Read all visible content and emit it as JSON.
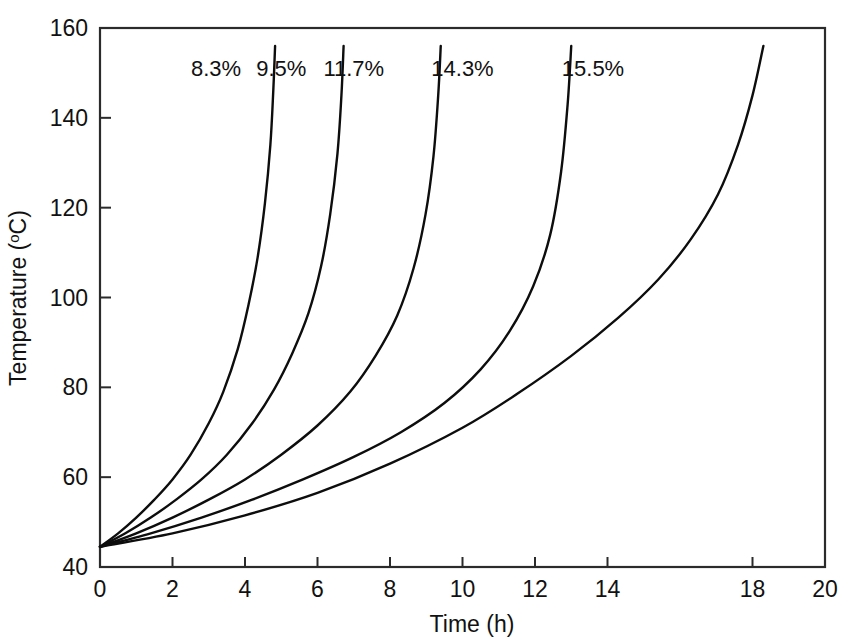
{
  "chart_data": {
    "type": "line",
    "title": "",
    "xlabel": "Time (h)",
    "ylabel": "Temperature (°C)",
    "ylabel_base": "Temperature (",
    "ylabel_degree": "o",
    "ylabel_tail": "C)",
    "xlim": [
      0,
      20
    ],
    "ylim": [
      40,
      160
    ],
    "xticks": [
      0,
      2,
      4,
      6,
      8,
      10,
      12,
      14,
      18,
      20
    ],
    "xtick_labels": [
      "0",
      "2",
      "4",
      "6",
      "8",
      "10",
      "12",
      "14",
      "18",
      "20"
    ],
    "yticks": [
      40,
      60,
      80,
      100,
      120,
      140,
      160
    ],
    "ytick_labels": [
      "40",
      "60",
      "80",
      "100",
      "120",
      "140",
      "160"
    ],
    "grid": false,
    "legend_position": "inline-curve-labels",
    "line_color": "#0d0d0d",
    "frame_color": "#2b2b2b",
    "background_color": "#ffffff",
    "start_point": [
      0,
      44.5
    ],
    "series": [
      {
        "name": "8.3%",
        "label": "8.3%",
        "label_at": [
          3.2,
          151
        ],
        "x": [
          0,
          0.5,
          1.0,
          1.5,
          2.0,
          2.5,
          3.0,
          3.4,
          3.8,
          4.1,
          4.35,
          4.55,
          4.7,
          4.78,
          4.83
        ],
        "y": [
          44.5,
          47.5,
          51.0,
          55.0,
          59.5,
          65.0,
          72.0,
          79.0,
          88.5,
          98.5,
          109.0,
          121.0,
          134.0,
          146.0,
          156.0
        ]
      },
      {
        "name": "9.5%",
        "label": "9.5%",
        "label_at": [
          5.0,
          151
        ],
        "x": [
          0,
          0.7,
          1.4,
          2.1,
          2.8,
          3.5,
          4.2,
          4.8,
          5.3,
          5.75,
          6.1,
          6.35,
          6.55,
          6.66,
          6.72
        ],
        "y": [
          44.5,
          47.5,
          51.0,
          55.0,
          59.5,
          65.0,
          72.0,
          79.5,
          87.5,
          96.5,
          107.0,
          118.5,
          132.0,
          145.0,
          156.0
        ]
      },
      {
        "name": "11.7%",
        "label": "11.7%",
        "label_at": [
          7.0,
          151
        ],
        "x": [
          0,
          1.0,
          2.0,
          3.0,
          4.0,
          5.0,
          6.0,
          6.9,
          7.6,
          8.2,
          8.65,
          8.98,
          9.2,
          9.33,
          9.4
        ],
        "y": [
          44.5,
          47.5,
          51.0,
          55.0,
          59.5,
          65.0,
          71.5,
          79.0,
          87.0,
          96.0,
          106.5,
          118.5,
          131.5,
          145.0,
          156.0
        ]
      },
      {
        "name": "14.3%",
        "label": "14.3%",
        "label_at": [
          10.0,
          151
        ],
        "x": [
          0,
          1.4,
          2.8,
          4.2,
          5.6,
          7.0,
          8.3,
          9.5,
          10.5,
          11.3,
          11.95,
          12.42,
          12.72,
          12.9,
          13.0
        ],
        "y": [
          44.5,
          47.5,
          51.0,
          55.0,
          59.5,
          64.5,
          70.0,
          76.5,
          84.0,
          92.5,
          102.5,
          114.0,
          128.0,
          143.0,
          156.0
        ]
      },
      {
        "name": "15.5%",
        "label": "15.5%",
        "label_at": [
          13.6,
          151
        ],
        "x": [
          0,
          2.0,
          4.0,
          6.0,
          8.0,
          10.0,
          11.5,
          13.0,
          14.3,
          15.4,
          16.3,
          17.05,
          17.6,
          18.0,
          18.3
        ],
        "y": [
          44.5,
          47.5,
          51.5,
          56.5,
          63.0,
          71.0,
          78.5,
          87.0,
          95.5,
          104.0,
          113.0,
          123.0,
          134.0,
          145.0,
          156.0
        ]
      }
    ]
  }
}
